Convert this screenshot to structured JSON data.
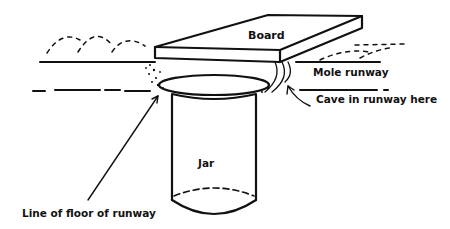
{
  "diagram": {
    "labels": {
      "board": "Board",
      "mole_runway": "Mole runway",
      "cave": "Cave in runway here",
      "jar": "Jar",
      "floor_line": "Line of floor of runway"
    },
    "colors": {
      "ink": "#111111",
      "background": "#ffffff"
    }
  }
}
